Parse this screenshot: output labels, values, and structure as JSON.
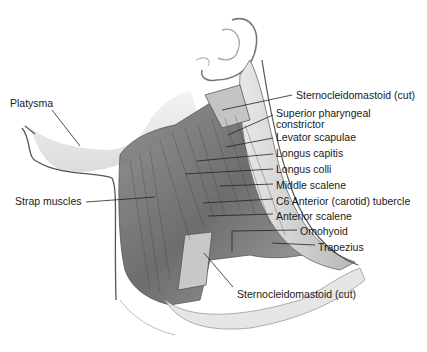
{
  "diagram": {
    "labels": [
      {
        "id": "platysma",
        "text": "Platysma",
        "x": 10,
        "y": 98,
        "line": [
          [
            52,
            110
          ],
          [
            80,
            146
          ]
        ]
      },
      {
        "id": "strap-muscles",
        "text": "Strap muscles",
        "x": 15,
        "y": 196,
        "line": [
          [
            86,
            202
          ],
          [
            155,
            197
          ]
        ]
      },
      {
        "id": "scm-cut-top",
        "text": "Sternocleidomastoid (cut)",
        "x": 296,
        "y": 90,
        "line": [
          [
            292,
            95
          ],
          [
            222,
            110
          ]
        ]
      },
      {
        "id": "superior-pharyngeal-constrictor",
        "text": "Superior pharyngeal",
        "text2": "constrictor",
        "x": 276,
        "y": 108,
        "line": [
          [
            273,
            115
          ],
          [
            228,
            135
          ]
        ]
      },
      {
        "id": "levator-scapulae",
        "text": "Levator scapulae",
        "x": 276,
        "y": 132,
        "line": [
          [
            273,
            138
          ],
          [
            226,
            147
          ]
        ]
      },
      {
        "id": "longus-capitis",
        "text": "Longus capitis",
        "x": 276,
        "y": 148,
        "line": [
          [
            273,
            154
          ],
          [
            197,
            161
          ]
        ]
      },
      {
        "id": "longus-colli",
        "text": "Longus colli",
        "x": 276,
        "y": 164,
        "line": [
          [
            273,
            169
          ],
          [
            185,
            174
          ]
        ]
      },
      {
        "id": "middle-scalene",
        "text": "Middle scalene",
        "x": 276,
        "y": 180,
        "line": [
          [
            273,
            184
          ],
          [
            220,
            186
          ]
        ]
      },
      {
        "id": "c6-tubercle",
        "text": "C6 Anterior (carotid) tubercle",
        "x": 276,
        "y": 196,
        "line": [
          [
            273,
            199
          ],
          [
            203,
            203
          ]
        ]
      },
      {
        "id": "anterior-scalene",
        "text": "Anterior scalene",
        "x": 276,
        "y": 211,
        "line": [
          [
            273,
            214
          ],
          [
            208,
            216
          ]
        ]
      },
      {
        "id": "omohyoid",
        "text": "Omohyoid",
        "x": 300,
        "y": 226,
        "line": [
          [
            297,
            230
          ],
          [
            232,
            231
          ]
        ]
      },
      {
        "id": "trapezius",
        "text": "Trapezius",
        "x": 318,
        "y": 242,
        "line": [
          [
            315,
            245
          ],
          [
            272,
            243
          ]
        ]
      },
      {
        "id": "scm-cut-bottom",
        "text": "Sternocleidomastoid (cut)",
        "x": 237,
        "y": 289,
        "line": [
          [
            233,
            287
          ],
          [
            204,
            253
          ]
        ]
      }
    ]
  },
  "colors": {
    "background": "#ffffff",
    "muscle_dark": "#6e6e6e",
    "muscle_mid": "#9a9a9a",
    "muscle_light": "#cfcfcf",
    "outline": "#4a4a4a",
    "label_text": "#1a1a1a",
    "leader_line": "#222222"
  }
}
